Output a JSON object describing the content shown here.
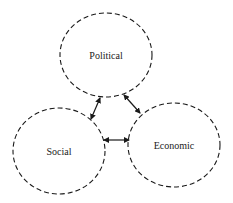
{
  "diagram": {
    "type": "three-circle interaction diagram",
    "nodes": [
      {
        "id": "political",
        "label": "Political",
        "cx": 106,
        "cy": 55,
        "rx": 46,
        "ry": 42
      },
      {
        "id": "social",
        "label": "Social",
        "cx": 59,
        "cy": 151,
        "rx": 46,
        "ry": 43
      },
      {
        "id": "economic",
        "label": "Economic",
        "cx": 174,
        "cy": 145,
        "rx": 46,
        "ry": 42
      }
    ],
    "edges": [
      {
        "from": "political",
        "to": "social",
        "direction": "bidirectional"
      },
      {
        "from": "political",
        "to": "economic",
        "direction": "bidirectional"
      },
      {
        "from": "social",
        "to": "economic",
        "direction": "bidirectional"
      }
    ],
    "colors": {
      "stroke": "#1a1a1a",
      "background": "#ffffff",
      "text": "#222222"
    }
  }
}
